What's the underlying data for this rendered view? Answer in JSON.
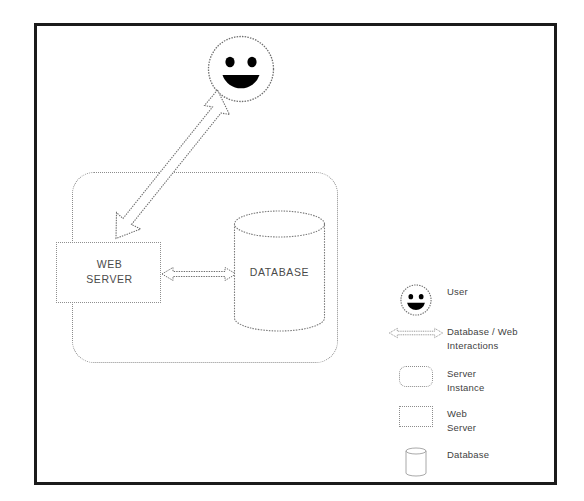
{
  "diagram": {
    "frame": {
      "name": "outer-border"
    },
    "nodes": {
      "user": {
        "icon": "smiley-face-icon",
        "label": ""
      },
      "server_instance": {
        "label": ""
      },
      "web_server": {
        "label": "WEB\nSERVER"
      },
      "database": {
        "label": "DATABASE"
      }
    },
    "connections": {
      "user_to_web_server": {
        "icon": "double-headed-diagonal-arrow-icon",
        "label": ""
      },
      "web_server_to_database": {
        "icon": "double-headed-horizontal-arrow-icon",
        "label": ""
      }
    }
  },
  "legend": {
    "items": [
      {
        "icon": "smiley-face-icon",
        "label": "User"
      },
      {
        "icon": "double-headed-arrow-icon",
        "label": "Database / Web\nInteractions"
      },
      {
        "icon": "rounded-rectangle-icon",
        "label": "Server\nInstance"
      },
      {
        "icon": "rectangle-icon",
        "label": "Web\nServer"
      },
      {
        "icon": "cylinder-icon",
        "label": "Database"
      }
    ]
  },
  "colors": {
    "frame": "#1b1b1b",
    "stroke": "#8c8c8c",
    "text": "#3f3f3f",
    "background": "#ffffff"
  }
}
